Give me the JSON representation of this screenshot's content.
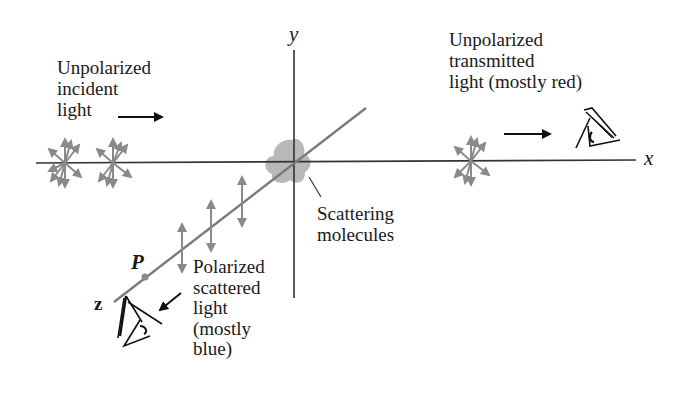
{
  "diagram": {
    "axes": {
      "x_label": "x",
      "y_label": "y",
      "z_label": "z"
    },
    "point_label": "P",
    "labels": {
      "incident": "Unpolarized\nincident\nlight",
      "transmitted": "Unpolarized\ntransmitted\nlight (mostly red)",
      "scatterer": "Scattering\nmolecules",
      "scattered": "Polarized\nscattered\nlight\n(mostly\nblue)"
    },
    "colors": {
      "line": "#333333",
      "arrow_gray": "#8a8a8a",
      "blob_gray": "#b8b8b8",
      "z_axis_gray": "#7a7a7a",
      "text": "#1a1a1a"
    },
    "elements": {
      "unpolarized_bursts": 3,
      "polarized_arrows": 3,
      "observers": 2
    }
  }
}
